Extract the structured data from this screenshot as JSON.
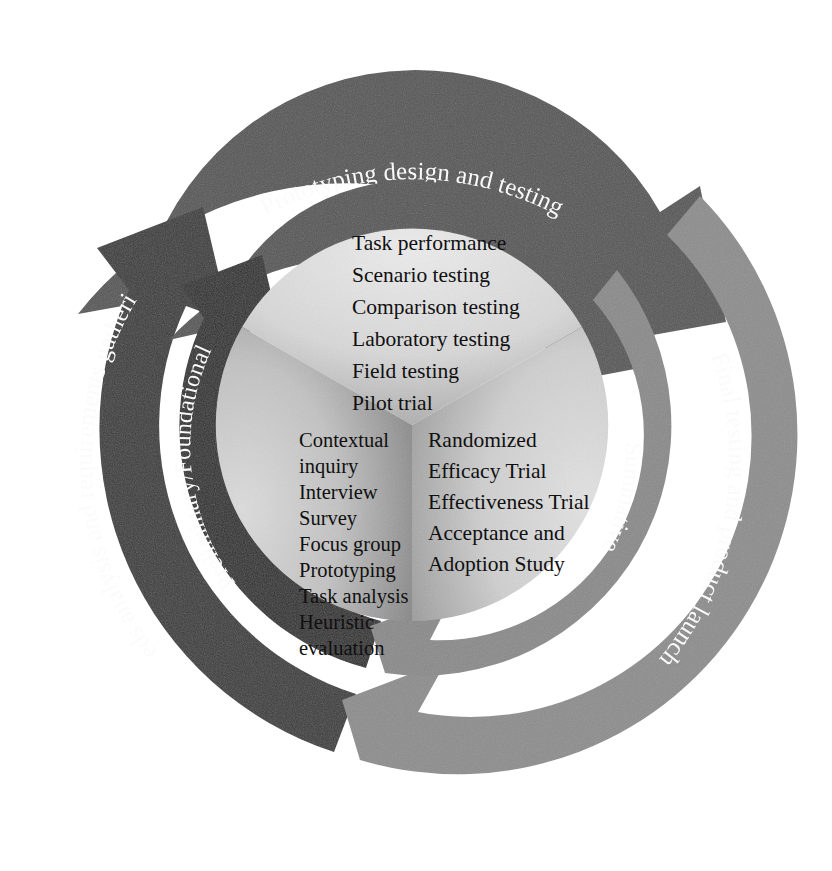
{
  "diagram": {
    "center": {
      "x": 412,
      "y": 425
    },
    "colors": {
      "outer_top": "#565656",
      "outer_left": "#3b3b3b",
      "outer_right": "#8d8d8d",
      "inner_top": "#565656",
      "inner_left": "#2f2f2f",
      "inner_right": "#8a8a8a",
      "sector_top_light": "#e8e8e8",
      "sector_top_dark": "#9e9e9e",
      "sector_left_light": "#d2d2d2",
      "sector_left_dark": "#6e6e6e",
      "sector_right_light": "#dcdcdc",
      "sector_right_dark": "#8b8b8b",
      "text_dark": "#101010",
      "text_light": "#ffffff",
      "background": "#ffffff"
    },
    "outer_ring": {
      "name": "phase-ring",
      "segments": [
        {
          "id": "outer-top",
          "label": "Prototyping design and testing"
        },
        {
          "id": "outer-left",
          "label": "Needs analysis and requirements gathering"
        },
        {
          "id": "outer-right",
          "label": "Final testing and product launch"
        }
      ]
    },
    "inner_ring": {
      "name": "evaluation-type-ring",
      "segments": [
        {
          "id": "inner-top",
          "label": "Formative"
        },
        {
          "id": "inner-left",
          "label": "Preliminary/Foundational"
        },
        {
          "id": "inner-right",
          "label": "Summative"
        }
      ]
    },
    "center_sectors": [
      {
        "id": "sector-top",
        "name": "formative-methods",
        "items": [
          "Task performance",
          "Scenario testing",
          "Comparison testing",
          "Laboratory testing",
          "Field testing",
          "Pilot trial"
        ]
      },
      {
        "id": "sector-left",
        "name": "preliminary-methods",
        "items": [
          "Contextual",
          "inquiry",
          "Interview",
          "Survey",
          "Focus group",
          "Prototyping",
          "Task analysis",
          "Heuristic",
          "evaluation"
        ]
      },
      {
        "id": "sector-right",
        "name": "summative-methods",
        "items": [
          "Randomized",
          "Efficacy Trial",
          "Effectiveness Trial",
          "Acceptance and",
          "Adoption Study"
        ]
      }
    ]
  }
}
